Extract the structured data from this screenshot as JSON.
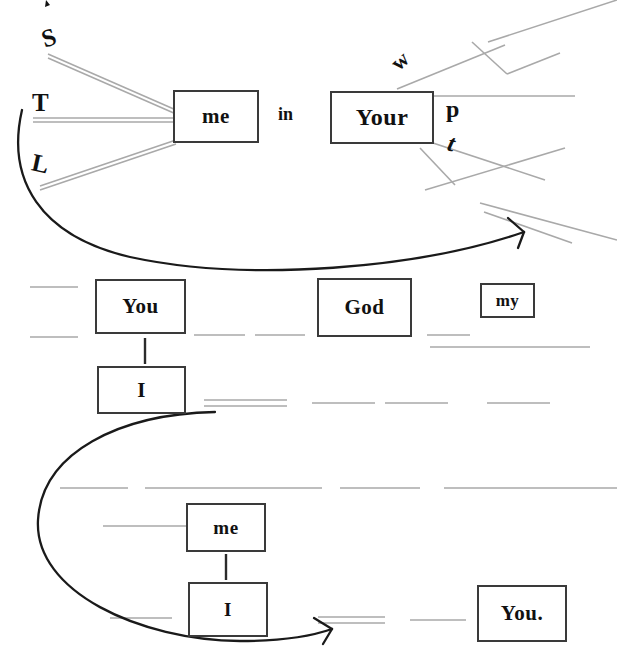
{
  "document": {
    "kind": "sentence-diagram",
    "title": "Sentence diagram worksheet",
    "background_color": "#ffffff",
    "box_border_color": "#3a3a3a",
    "text_color": "#111111",
    "blank_line_color": "#a9a9a9",
    "arrow_color": "#1a1a1a"
  },
  "boxes": [
    {
      "id": "box-me-top",
      "label": "me",
      "x": 173,
      "y": 90,
      "w": 86,
      "h": 53,
      "font_size": 21
    },
    {
      "id": "box-your",
      "label": "Your",
      "x": 330,
      "y": 91,
      "w": 104,
      "h": 53,
      "font_size": 24
    },
    {
      "id": "box-you",
      "label": "You",
      "x": 95,
      "y": 279,
      "w": 91,
      "h": 55,
      "font_size": 21
    },
    {
      "id": "box-god",
      "label": "God",
      "x": 317,
      "y": 278,
      "w": 95,
      "h": 59,
      "font_size": 21
    },
    {
      "id": "box-my",
      "label": "my",
      "x": 480,
      "y": 283,
      "w": 55,
      "h": 35,
      "font_size": 17
    },
    {
      "id": "box-i-mid",
      "label": "I",
      "x": 97,
      "y": 366,
      "w": 89,
      "h": 48,
      "font_size": 21
    },
    {
      "id": "box-me-bot",
      "label": "me",
      "x": 186,
      "y": 503,
      "w": 80,
      "h": 49,
      "font_size": 19
    },
    {
      "id": "box-i-bot",
      "label": "I",
      "x": 188,
      "y": 582,
      "w": 80,
      "h": 55,
      "font_size": 19
    },
    {
      "id": "box-you-end",
      "label": "You.",
      "x": 477,
      "y": 585,
      "w": 90,
      "h": 57,
      "font_size": 21
    }
  ],
  "free_words": [
    {
      "id": "word-s",
      "label": "S",
      "x": 42,
      "y": 24,
      "font_size": 25,
      "rotate": -18
    },
    {
      "id": "word-t",
      "label": "T",
      "x": 32,
      "y": 89,
      "font_size": 25,
      "rotate": 0
    },
    {
      "id": "word-l",
      "label": "L",
      "x": 32,
      "y": 150,
      "font_size": 25,
      "rotate": 12
    },
    {
      "id": "word-in",
      "label": "in",
      "x": 278,
      "y": 104,
      "font_size": 18,
      "rotate": 0
    },
    {
      "id": "word-w",
      "label": "w",
      "x": 392,
      "y": 48,
      "font_size": 22,
      "rotate": -42
    },
    {
      "id": "word-p",
      "label": "p",
      "x": 446,
      "y": 96,
      "font_size": 24,
      "rotate": 0
    },
    {
      "id": "word-t2",
      "label": "t",
      "x": 448,
      "y": 130,
      "font_size": 24,
      "rotate": 14
    }
  ],
  "connectors": [
    {
      "id": "connector-you-to-i",
      "from": "box-you",
      "to": "box-i-mid",
      "orientation": "vertical"
    },
    {
      "id": "connector-me-to-i",
      "from": "box-me-bot",
      "to": "box-i-bot",
      "orientation": "vertical"
    }
  ],
  "arrows": [
    {
      "id": "arrow-upper",
      "description": "large curved arrow from left of T/L down under the first line sweeping right to below the Your phrase"
    },
    {
      "id": "arrow-lower",
      "description": "large curved arrow from below the I box sweeping left, down and right to the equals marks before You."
    }
  ],
  "blank_lines_note": "faint gray rules standing in for unlabeled / hidden words",
  "counts": {
    "boxes": 9,
    "free_words": 7,
    "arrows": 2
  }
}
